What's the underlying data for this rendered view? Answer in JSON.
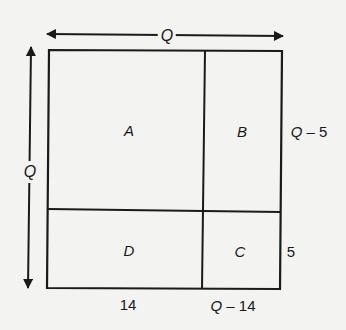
{
  "diagram": {
    "width_label": "Q",
    "height_label": "Q",
    "regions": {
      "A": "A",
      "B": "B",
      "C": "C",
      "D": "D"
    },
    "right_labels": {
      "top": "Q – 5",
      "bottom": "5"
    },
    "bottom_labels": {
      "left": "14",
      "right": "Q – 14"
    },
    "colors": {
      "line": "#1a1a1a",
      "background": "#f3f3f1"
    }
  }
}
